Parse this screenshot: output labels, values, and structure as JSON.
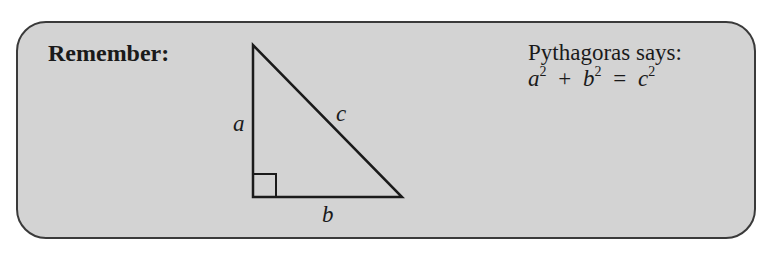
{
  "callout": {
    "heading": "Remember:",
    "caption": "Pythagoras says:",
    "formula": {
      "a": "a",
      "a_exp": "2",
      "plus": "+",
      "b": "b",
      "b_exp": "2",
      "equals": "=",
      "c": "c",
      "c_exp": "2"
    }
  },
  "triangle": {
    "labels": {
      "side_a": "a",
      "side_b": "b",
      "side_c": "c"
    },
    "right_angle": true,
    "colors": {
      "stroke": "#1a1a1a",
      "background": "#d3d3d3",
      "border": "#3a3a3a"
    }
  }
}
